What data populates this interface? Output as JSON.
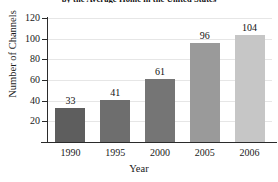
{
  "chart_data": {
    "type": "bar",
    "title": "by the Average Home in the United States",
    "title_note": "top line of title cropped out of screenshot",
    "categories": [
      "1990",
      "1995",
      "2000",
      "2005",
      "2006"
    ],
    "values": [
      33,
      41,
      61,
      96,
      104
    ],
    "value_labels": [
      "33",
      "41",
      "61",
      "96",
      "104"
    ],
    "xlabel": "Year",
    "ylabel": "Number of Channels",
    "ylim": [
      0,
      120
    ],
    "yticks": [
      20,
      40,
      60,
      80,
      100,
      120
    ],
    "ytick_labels": [
      "20",
      "40",
      "60",
      "80",
      "100",
      "120"
    ],
    "grid": "horizontal",
    "legend": "none",
    "bar_colors": [
      "#5e5e5e",
      "#6e6e6e",
      "#757575",
      "#9a9a9a",
      "#c6c6c6"
    ],
    "axis_color": "#2b2b2b",
    "gridline_color": "#e6e6e6",
    "background": "#ffffff"
  }
}
